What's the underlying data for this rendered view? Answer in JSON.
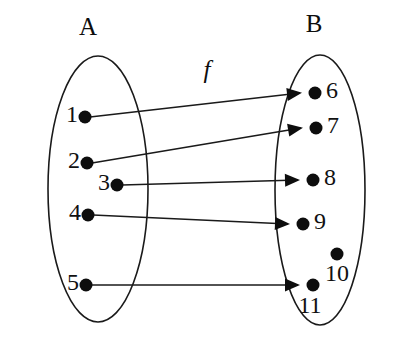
{
  "diagram": {
    "type": "function-mapping-diagram",
    "function_label": "f",
    "sets": [
      {
        "id": "A",
        "name": "A",
        "label_x": 88,
        "label_y": 29,
        "ellipse": {
          "cx": 98,
          "cy": 189,
          "rx": 50,
          "ry": 133
        },
        "elements": [
          {
            "value": "1",
            "dot_x": 85,
            "dot_y": 117,
            "dot_r": 6.5,
            "label_x": 78,
            "label_y": 116,
            "label_align": "left"
          },
          {
            "value": "2",
            "dot_x": 87,
            "dot_y": 163,
            "dot_r": 6.5,
            "label_x": 80,
            "label_y": 162,
            "label_align": "left"
          },
          {
            "value": "3",
            "dot_x": 117,
            "dot_y": 185,
            "dot_r": 6.5,
            "label_x": 110,
            "label_y": 184,
            "label_align": "left"
          },
          {
            "value": "4",
            "dot_x": 88,
            "dot_y": 215,
            "dot_r": 6.5,
            "label_x": 81,
            "label_y": 214,
            "label_align": "left"
          },
          {
            "value": "5",
            "dot_x": 86,
            "dot_y": 285,
            "dot_r": 6.5,
            "label_x": 79,
            "label_y": 284,
            "label_align": "left"
          }
        ]
      },
      {
        "id": "B",
        "name": "B",
        "label_x": 314,
        "label_y": 26,
        "ellipse": {
          "cx": 320,
          "cy": 190,
          "rx": 45,
          "ry": 135
        },
        "elements": [
          {
            "value": "6",
            "dot_x": 315,
            "dot_y": 93,
            "dot_r": 6.5,
            "label_x": 326,
            "label_y": 92,
            "label_align": "right"
          },
          {
            "value": "7",
            "dot_x": 316,
            "dot_y": 128,
            "dot_r": 6.5,
            "label_x": 327,
            "label_y": 127,
            "label_align": "right"
          },
          {
            "value": "8",
            "dot_x": 313,
            "dot_y": 180,
            "dot_r": 6.5,
            "label_x": 324,
            "label_y": 179,
            "label_align": "right"
          },
          {
            "value": "9",
            "dot_x": 303,
            "dot_y": 224,
            "dot_r": 6.5,
            "label_x": 314,
            "label_y": 223,
            "label_align": "right"
          },
          {
            "value": "10",
            "dot_x": 337,
            "dot_y": 254,
            "dot_r": 6.5,
            "label_x": 337,
            "label_y": 275,
            "label_align": "center"
          },
          {
            "value": "11",
            "dot_x": 313,
            "dot_y": 285,
            "dot_r": 6.5,
            "label_x": 310,
            "label_y": 307,
            "label_align": "center"
          }
        ]
      }
    ],
    "function_label_x": 207,
    "function_label_y": 72,
    "mappings": [
      {
        "from": "1",
        "to": "6",
        "x1": 90,
        "y1": 117,
        "x2": 300,
        "y2": 93
      },
      {
        "from": "2",
        "to": "7",
        "x1": 92,
        "y1": 163,
        "x2": 301,
        "y2": 128
      },
      {
        "from": "3",
        "to": "8",
        "x1": 122,
        "y1": 185,
        "x2": 298,
        "y2": 180
      },
      {
        "from": "4",
        "to": "9",
        "x1": 93,
        "y1": 215,
        "x2": 288,
        "y2": 224
      },
      {
        "from": "5",
        "to": "11",
        "x1": 91,
        "y1": 285,
        "x2": 298,
        "y2": 285
      }
    ],
    "unmapped_in_B": [
      "10"
    ],
    "colors": {
      "stroke": "#1a1a1a",
      "dot": "#0d0d0d",
      "background": "#ffffff"
    }
  }
}
